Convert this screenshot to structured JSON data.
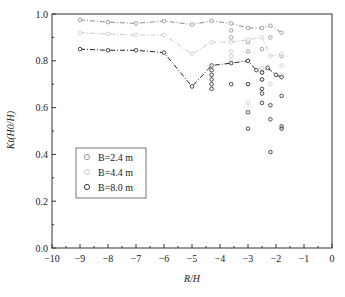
{
  "chart_data": {
    "type": "line",
    "title": "",
    "xlabel": "R/H",
    "ylabel": "Kt(H0/H)",
    "xlim": [
      -10,
      0
    ],
    "ylim": [
      0.0,
      1.0
    ],
    "x_ticks": [
      "-10",
      "-9",
      "-8",
      "-7",
      "-6",
      "-5",
      "-4",
      "-3",
      "-2",
      "-1",
      "0"
    ],
    "y_ticks": [
      "0.0",
      "0.2",
      "0.4",
      "0.6",
      "0.8",
      "1.0"
    ],
    "grid": false,
    "legend_position": "center-left",
    "series": [
      {
        "name": "B=2.4 m",
        "color": "#8c8c8c",
        "line_style": "dash-dot",
        "marker": "open-circle",
        "line": {
          "x": [
            -9.0,
            -8.0,
            -7.0,
            -6.0,
            -5.0,
            -4.3,
            -3.6,
            -3.0,
            -2.5,
            -2.2,
            -1.8
          ],
          "y": [
            0.975,
            0.965,
            0.96,
            0.97,
            0.955,
            0.97,
            0.96,
            0.94,
            0.94,
            0.95,
            0.92
          ]
        },
        "scatter": {
          "x": [
            -3.6,
            -3.6,
            -3.0,
            -3.0,
            -3.0,
            -2.5,
            -2.5,
            -2.2,
            -1.8
          ],
          "y": [
            0.93,
            0.9,
            0.88,
            0.84,
            0.8,
            0.85,
            0.75,
            0.9,
            0.82
          ]
        }
      },
      {
        "name": "B=4.4 m",
        "color": "#c8c8c8",
        "line_style": "dash-dot",
        "marker": "open-circle",
        "line": {
          "x": [
            -9.0,
            -8.0,
            -7.0,
            -6.0,
            -5.0,
            -4.3,
            -3.6,
            -3.0,
            -2.5,
            -2.2,
            -1.8
          ],
          "y": [
            0.92,
            0.915,
            0.91,
            0.91,
            0.83,
            0.88,
            0.88,
            0.89,
            0.9,
            0.82,
            0.83
          ]
        },
        "scatter": {
          "x": [
            -3.6,
            -3.6,
            -3.6,
            -3.0,
            -3.0,
            -2.5,
            -2.5,
            -2.2,
            -1.8,
            -1.8
          ],
          "y": [
            0.84,
            0.82,
            0.8,
            0.7,
            0.62,
            0.77,
            0.72,
            0.7,
            0.78,
            0.74
          ]
        }
      },
      {
        "name": "B=8.0 m",
        "color": "#222222",
        "line_style": "dash-dot",
        "marker": "open-circle",
        "line": {
          "x": [
            -9.0,
            -8.0,
            -7.0,
            -6.0,
            -5.0,
            -4.3,
            -3.6,
            -3.0,
            -2.7,
            -2.5,
            -2.3,
            -2.0,
            -1.8
          ],
          "y": [
            0.85,
            0.845,
            0.845,
            0.835,
            0.69,
            0.78,
            0.79,
            0.8,
            0.76,
            0.75,
            0.77,
            0.74,
            0.73
          ]
        },
        "scatter": {
          "x": [
            -4.3,
            -4.3,
            -4.3,
            -4.3,
            -4.3,
            -3.6,
            -3.0,
            -3.0,
            -3.0,
            -2.5,
            -2.5,
            -2.5,
            -2.5,
            -2.2,
            -2.2,
            -2.2,
            -1.8,
            -1.8,
            -1.8
          ],
          "y": [
            0.76,
            0.74,
            0.72,
            0.7,
            0.68,
            0.7,
            0.7,
            0.58,
            0.51,
            0.72,
            0.68,
            0.66,
            0.62,
            0.61,
            0.55,
            0.41,
            0.65,
            0.51,
            0.52
          ]
        }
      }
    ]
  },
  "legend": {
    "items": [
      {
        "label": "B=2.4 m",
        "color": "#8c8c8c"
      },
      {
        "label": "B=4.4 m",
        "color": "#c8c8c8"
      },
      {
        "label": "B=8.0 m",
        "color": "#222222"
      }
    ]
  },
  "axes": {
    "xlabel": "R/H",
    "ylabel": "Kt(H0/H)"
  }
}
